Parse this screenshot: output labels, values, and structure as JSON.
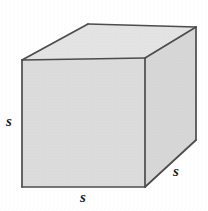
{
  "figure": {
    "type": "geometric-solid",
    "shape_name": "cube",
    "background_color": "#ffffff",
    "edge_color": "#4a4a4a",
    "faces": {
      "front": {
        "name": "front-face",
        "fill": "#dcdcdc"
      },
      "top": {
        "name": "top-face",
        "fill": "#e4e4e4"
      },
      "right": {
        "name": "right-face",
        "fill": "#d6d6d6"
      }
    },
    "labels": {
      "left": "s",
      "bottom": "s",
      "right": "s"
    },
    "geometry": {
      "front_top_left": [
        22,
        60
      ],
      "front_top_right": [
        145,
        58
      ],
      "front_bottom_right": [
        145,
        187
      ],
      "front_bottom_left": [
        22,
        187
      ],
      "back_top_left": [
        88,
        24
      ],
      "back_top_right": [
        196,
        27
      ],
      "back_bottom_right": [
        196,
        140
      ]
    }
  }
}
